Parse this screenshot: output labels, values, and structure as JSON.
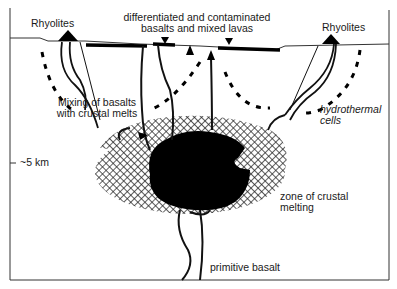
{
  "diagram": {
    "labels": {
      "rhyolites_left": "Rhyolites",
      "rhyolites_right": "Rhyolites",
      "top_center_line1": "differentiated and contaminated",
      "top_center_line2": "basalts and mixed lavas",
      "mixing_line1": "Mixing of basalts",
      "mixing_line2": "with crustal melts",
      "hydrothermal_line1": "hydrothermal",
      "hydrothermal_line2": "cells",
      "depth_marker": "~5 km",
      "crustal_zone_line1": "zone of crustal",
      "crustal_zone_line2": "melting",
      "primitive_basalt": "primitive basalt"
    },
    "elements": [
      {
        "name": "surface-line",
        "description": "ground surface line"
      },
      {
        "name": "lava-flows",
        "description": "thick black surface lava flows"
      },
      {
        "name": "magma-chamber",
        "description": "black basaltic magma body"
      },
      {
        "name": "crustal-melt-zone",
        "description": "cross-hatched zone of crustal melting"
      },
      {
        "name": "hydrothermal-cells",
        "description": "dashed convection arcs with arrows"
      },
      {
        "name": "feeder-dikes",
        "description": "conduits from chamber to surface"
      },
      {
        "name": "rhyolite-domes",
        "description": "black triangular vents at left and right"
      }
    ],
    "colors": {
      "ink": "#111111",
      "frame": "#333333",
      "background": "#ffffff"
    }
  }
}
